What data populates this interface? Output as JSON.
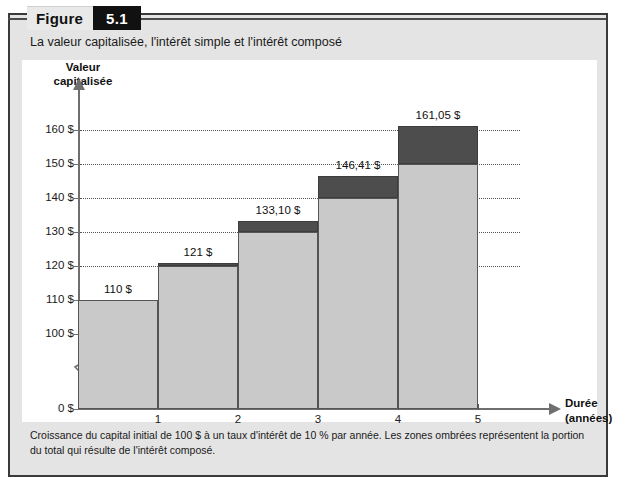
{
  "figure": {
    "tab_word": "Figure",
    "tab_number": "5.1",
    "subtitle": "La valeur capitalisée, l'intérêt simple et l'intérêt composé",
    "caption": "Croissance du capital initial de 100 $ à un taux d'intérêt de 10 % par année. Les zones ombrées représentent la portion du total qui résulte de l'intérêt composé."
  },
  "colors": {
    "frame_border": "#3a3a3a",
    "panel_bg": "#e4e4e4",
    "plot_bg": "#ffffff",
    "badge_bg": "#111111",
    "badge_text": "#ffffff",
    "tab_bg": "#e9e9e9",
    "bar_simple": "#c9c9c9",
    "bar_compound": "#4d4d4d",
    "axis": "#6f6f6f",
    "gridline": "#555555"
  },
  "chart_data": {
    "type": "bar",
    "title": "La valeur capitalisée, l'intérêt simple et l'intérêt composé",
    "xlabel": "Durée (années)",
    "ylabel": "Valeur capitalisée",
    "xlabel_line1": "Durée",
    "xlabel_line2": "(années)",
    "ylabel_line1": "Valeur",
    "ylabel_line2": "capitalisée",
    "categories": [
      "1",
      "2",
      "3",
      "4",
      "5"
    ],
    "x_tick_labels": [
      "1",
      "2",
      "3",
      "4",
      "5"
    ],
    "y_tick_labels": [
      "160 $",
      "150 $",
      "140 $",
      "130 $",
      "120 $",
      "110 $",
      "100 $",
      "0 $"
    ],
    "y_tick_values": [
      160,
      150,
      140,
      130,
      120,
      110,
      100,
      0
    ],
    "gridlines_at": [
      160,
      150,
      140,
      130,
      120
    ],
    "grid": true,
    "legend": "none",
    "axis_break": true,
    "axis_break_between": [
      0,
      100
    ],
    "ylim": [
      100,
      165
    ],
    "principal": 100,
    "rate_percent": 10,
    "series": [
      {
        "name": "Intérêt simple (portion claire)",
        "color": "#c9c9c9",
        "values": [
          110,
          120,
          130,
          140,
          150
        ]
      },
      {
        "name": "Intérêt composé (zone ombrée)",
        "color": "#4d4d4d",
        "values": [
          0,
          1,
          3.1,
          6.41,
          11.05
        ]
      }
    ],
    "totals": [
      110,
      121,
      133.1,
      146.41,
      161.05
    ],
    "data_labels": [
      "110 $",
      "121 $",
      "133,10 $",
      "146,41 $",
      "161,05 $"
    ]
  }
}
